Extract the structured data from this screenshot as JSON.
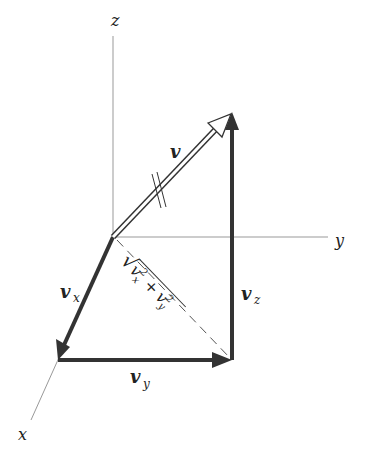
{
  "diagram": {
    "axes": {
      "x": {
        "label": "x"
      },
      "y": {
        "label": "y"
      },
      "z": {
        "label": "z"
      }
    },
    "vectors": {
      "v": {
        "label": "v",
        "style": "open-double-arrow",
        "tick_marks": "parallel"
      },
      "vx": {
        "label": "v",
        "subscript": "x"
      },
      "vy": {
        "label": "v",
        "subscript": "y"
      },
      "vz": {
        "label": "v",
        "subscript": "z"
      }
    },
    "diagonal": {
      "label_radical": "√",
      "term1_base": "v",
      "term1_sub": "x",
      "term1_sup": "2",
      "plus": "+",
      "term2_base": "v",
      "term2_sub": "y",
      "term2_sup": "2"
    },
    "colors": {
      "axis": "#888888",
      "vector": "#333333",
      "text": "#222222"
    }
  }
}
